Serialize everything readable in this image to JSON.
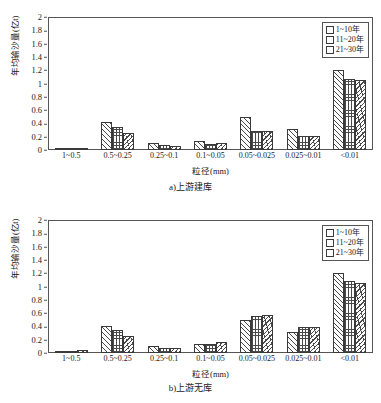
{
  "figures": [
    {
      "caption": "a)上游建库",
      "chart": {
        "ylabel": "年均输沙量(亿t)",
        "xlabel": "粒径(mm)",
        "y_ticks": [
          "2",
          "1.8",
          "1.6",
          "1.4",
          "1.2",
          "1",
          "0.8",
          "0.6",
          "0.4",
          "0.2",
          "0"
        ],
        "legend": [
          "1~10年",
          "11~20年",
          "21~30年"
        ]
      }
    },
    {
      "caption": "b)上游无库",
      "chart": {
        "ylabel": "年均输沙量(亿t)",
        "xlabel": "粒径(mm)",
        "y_ticks": [
          "2",
          "1.8",
          "1.6",
          "1.4",
          "1.2",
          "1",
          "0.8",
          "0.6",
          "0.4",
          "0.2",
          "0"
        ],
        "legend": [
          "1~10年",
          "11~20年",
          "21~30年"
        ]
      }
    }
  ],
  "chart_data": [
    {
      "type": "bar",
      "title": "a)上游建库",
      "xlabel": "粒径(mm)",
      "ylabel": "年均输沙量(亿t)",
      "ylim": [
        0,
        2
      ],
      "ytick_step": 0.2,
      "grid": false,
      "legend_position": "top-right",
      "categories": [
        "1~0.5",
        "0.5~0.25",
        "0.25~0.1",
        "0.1~0.05",
        "0.05~0.025",
        "0.025~0.01",
        "<0.01"
      ],
      "series": [
        {
          "name": "1~10年",
          "values": [
            0.01,
            0.42,
            0.1,
            0.13,
            0.5,
            0.32,
            1.2
          ]
        },
        {
          "name": "11~20年",
          "values": [
            0.02,
            0.35,
            0.07,
            0.09,
            0.28,
            0.21,
            1.07
          ]
        },
        {
          "name": "21~30年",
          "values": [
            0.03,
            0.25,
            0.06,
            0.1,
            0.28,
            0.21,
            1.06
          ]
        }
      ]
    },
    {
      "type": "bar",
      "title": "b)上游无库",
      "xlabel": "粒径(mm)",
      "ylabel": "年均输沙量(亿t)",
      "ylim": [
        0,
        2
      ],
      "ytick_step": 0.2,
      "grid": false,
      "legend_position": "top-right",
      "categories": [
        "1~0.5",
        "0.5~0.25",
        "0.25~0.1",
        "0.1~0.05",
        "0.05~0.025",
        "0.025~0.01",
        "<0.01"
      ],
      "series": [
        {
          "name": "1~10年",
          "values": [
            0.01,
            0.41,
            0.11,
            0.14,
            0.5,
            0.32,
            1.2
          ]
        },
        {
          "name": "11~20年",
          "values": [
            0.03,
            0.35,
            0.08,
            0.14,
            0.55,
            0.39,
            1.09
          ]
        },
        {
          "name": "21~30年",
          "values": [
            0.04,
            0.25,
            0.07,
            0.16,
            0.57,
            0.39,
            1.06
          ]
        }
      ]
    }
  ]
}
